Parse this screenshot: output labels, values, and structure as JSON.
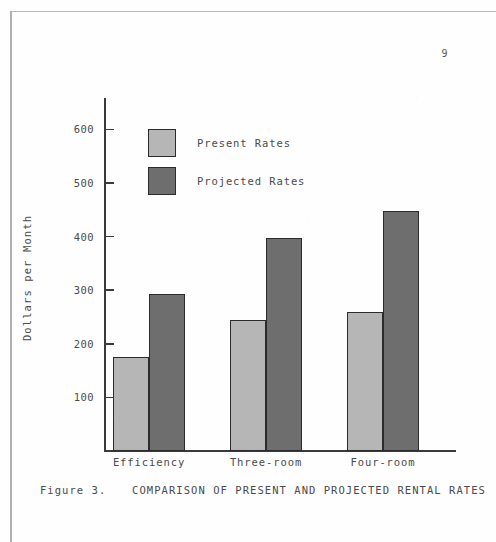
{
  "document": {
    "page_number": "9",
    "caption_prefix": "Figure 3.",
    "caption_text": "COMPARISON OF PRESENT AND PROJECTED RENTAL RATES"
  },
  "chart_data": {
    "type": "bar",
    "title": "",
    "subtitle": "",
    "xlabel": "",
    "ylabel": "Dollars per Month",
    "categories": [
      "Efficiency",
      "Three-room",
      "Four-room"
    ],
    "series": [
      {
        "name": "Present Rates",
        "color": "#b6b6b6",
        "values": [
          175,
          245,
          260
        ]
      },
      {
        "name": "Projected Rates",
        "color": "#6e6e6e",
        "values": [
          293,
          398,
          447
        ]
      }
    ],
    "ylim": [
      0,
      650
    ],
    "yticks": [
      100,
      200,
      300,
      400,
      500,
      600
    ],
    "ytick_labels": [
      "100",
      "200",
      "300",
      "400",
      "500",
      "600"
    ],
    "grid": false,
    "legend_position": "upper-left-inside"
  },
  "legend": {
    "items": [
      {
        "label": "Present Rates",
        "color": "#b6b6b6"
      },
      {
        "label": "Projected Rates",
        "color": "#6e6e6e"
      }
    ]
  },
  "colors": {
    "present": "#b6b6b6",
    "projected": "#6e6e6e",
    "axis": "#3a3a3a",
    "text": "#4a4a4a",
    "bar_outline": "#2b2b2b",
    "page_border": "#b3b3b3",
    "page_background": "#fefefe"
  }
}
